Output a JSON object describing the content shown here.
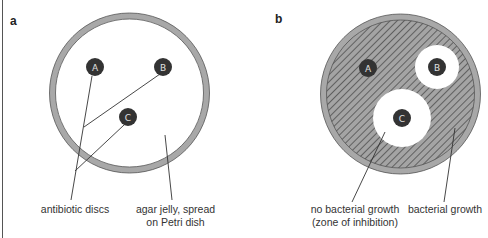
{
  "panels": [
    {
      "id": "a",
      "label": "a",
      "discs": [
        {
          "label": "A",
          "cx": 95,
          "cy": 67
        },
        {
          "label": "B",
          "cy": 67,
          "cx": 163
        },
        {
          "label": "C",
          "cx": 128,
          "cy": 117
        }
      ],
      "captions": {
        "discs": "antibiotic discs",
        "agar_line1": "agar jelly, spread",
        "agar_line2": "on Petri dish"
      }
    },
    {
      "id": "b",
      "label": "b",
      "discs": [
        {
          "label": "A",
          "cx": 368,
          "cy": 68
        },
        {
          "label": "B",
          "cx": 437,
          "cy": 67
        },
        {
          "label": "C",
          "cx": 402,
          "cy": 118
        }
      ],
      "captions": {
        "no_growth_line1": "no bacterial growth",
        "no_growth_line2": "(zone of inhibition)",
        "growth": "bacterial growth"
      }
    }
  ],
  "colors": {
    "ring": "#a8a8a8",
    "ring_stroke": "#555555",
    "disc": "#333333",
    "hatch_bg": "#9a9a9a",
    "hatch_line": "#3a3a3a",
    "leader": "#333333"
  }
}
